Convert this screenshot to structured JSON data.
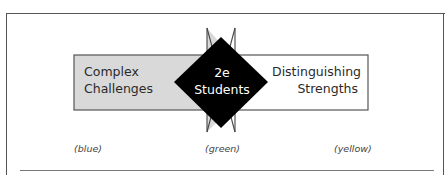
{
  "diagram": {
    "left_box": {
      "line1": "Complex",
      "line2": "Challenges",
      "fill": "#d9d9d9",
      "color_note": "(blue)"
    },
    "center": {
      "line1": "2e",
      "line2": "Students",
      "fill": "#000000",
      "color_note": "(green)"
    },
    "right_box": {
      "line1": "Distinguishing",
      "line2": "Strengths",
      "fill": "#ffffff",
      "color_note": "(yellow)"
    }
  }
}
